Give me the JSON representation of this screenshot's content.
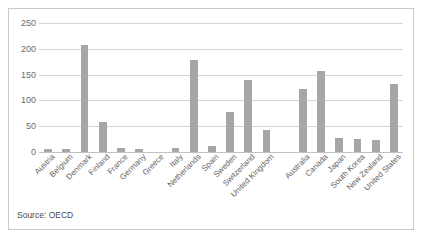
{
  "figure": {
    "source_note": "Source: OECD",
    "bar_color": "#a6a6a6",
    "gridline_color": "#d6d6d6",
    "border_color": "#c9c9c9",
    "axis_label_color": "#6b6b6b"
  },
  "chart_data": {
    "type": "bar",
    "title": "",
    "subtitle": "",
    "xlabel": "",
    "ylabel": "",
    "ylim": [
      0,
      250
    ],
    "yticks": [
      0,
      50,
      100,
      150,
      200,
      250
    ],
    "grid": true,
    "legend": false,
    "legend_position": "none",
    "annotations": [
      "Source: OECD"
    ],
    "categories": [
      "Austria",
      "Belgium",
      "Denmark",
      "Finland",
      "France",
      "Germany",
      "Greece",
      "Italy",
      "Netherlands",
      "Spain",
      "Sweden",
      "Switzerland",
      "United Kingdom",
      "",
      "Australia",
      "Canada",
      "Japan",
      "South Korea",
      "New Zealand",
      "United States"
    ],
    "values": [
      5,
      5,
      207,
      58,
      8,
      5,
      0,
      8,
      178,
      12,
      78,
      139,
      43,
      0,
      122,
      157,
      28,
      25,
      23,
      132
    ]
  }
}
